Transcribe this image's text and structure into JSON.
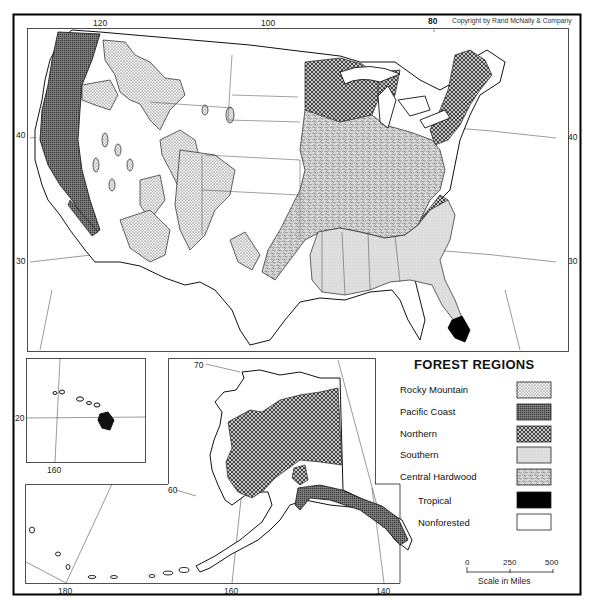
{
  "map": {
    "title": "FOREST REGIONS",
    "copyright": "Copyright by Rand McNally & Company",
    "main_panel": {
      "longitude_labels": [
        "120",
        "100",
        "80"
      ],
      "latitude_labels_left": [
        "40",
        "30"
      ],
      "latitude_labels_right": [
        "40",
        "30"
      ]
    },
    "hawaii_inset": {
      "latitude_label": "20",
      "longitude_label": "160"
    },
    "alaska_inset": {
      "latitude_labels": [
        "70",
        "60"
      ],
      "longitude_labels": [
        "180",
        "160",
        "140"
      ]
    },
    "legend": {
      "title": "FOREST REGIONS",
      "items": [
        {
          "label": "Rocky Mountain",
          "pattern": "fine-dots",
          "color": "#e6e6e6"
        },
        {
          "label": "Pacific Coast",
          "pattern": "dark-crosshatch",
          "color": "#6a6a6a"
        },
        {
          "label": "Northern",
          "pattern": "crosshatch",
          "color": "#a5a5a5"
        },
        {
          "label": "Southern",
          "pattern": "light-stipple",
          "color": "#dcdcdc"
        },
        {
          "label": "Central Hardwood",
          "pattern": "coarse-stipple",
          "color": "#c8c8c8"
        },
        {
          "label": "Tropical",
          "pattern": "solid",
          "color": "#000000"
        },
        {
          "label": "Nonforested",
          "pattern": "blank",
          "color": "#ffffff"
        }
      ]
    },
    "scale": {
      "ticks": [
        "0",
        "250",
        "500"
      ],
      "caption": "Scale in Miles"
    }
  }
}
